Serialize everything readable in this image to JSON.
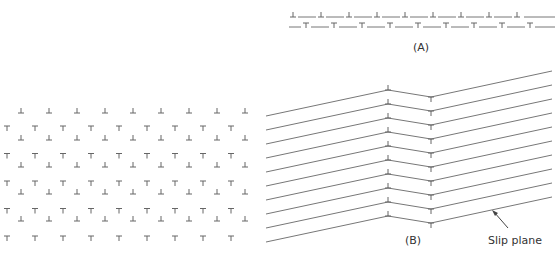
{
  "figure": {
    "panel_a": {
      "label": "(A)",
      "top_row_symbol": "⊥",
      "bottom_row_symbol": "⊤",
      "top_row_count": 9,
      "bottom_row_count": 9
    },
    "panel_b": {
      "label": "(B)",
      "annotation": "Slip plane",
      "line_count": 10,
      "kink_up_symbol": "⊥",
      "kink_down_symbol": "⊤"
    },
    "grid": {
      "edge_symbol_up": "⊥",
      "edge_symbol_down": "⊤",
      "rows_up": 5,
      "rows_down": 5,
      "cols": 9
    }
  },
  "colors": {
    "line": "#777777",
    "text": "#333333",
    "symbol": "#666666"
  }
}
